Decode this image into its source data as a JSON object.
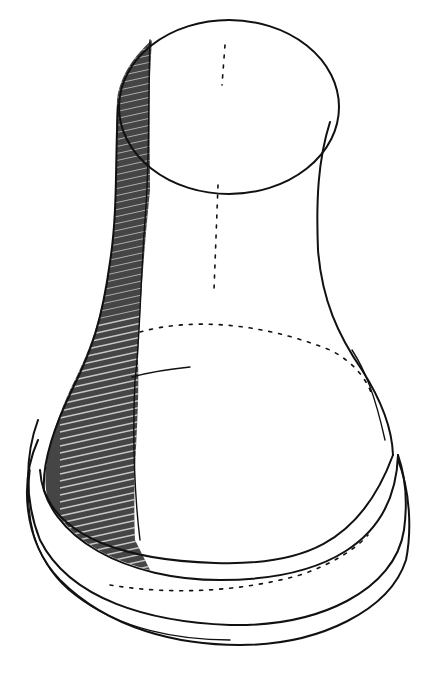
{
  "figure": {
    "style": "black ink hatched sketch on white",
    "colors": {
      "ink": "#111111",
      "paper": "#ffffff"
    }
  }
}
